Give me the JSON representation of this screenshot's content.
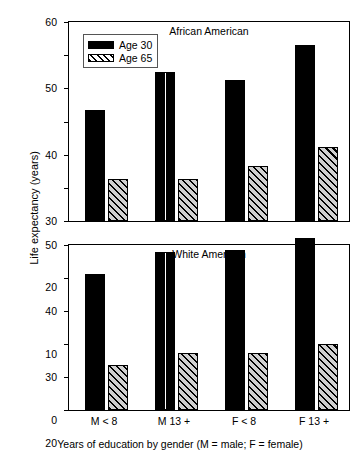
{
  "chart_data": {
    "type": "bar",
    "title": "",
    "xlabel": "Years of education by gender (M = male; F = female)",
    "ylabel": "Life expectancy (years)",
    "categories": [
      "M < 8",
      "M 13 +",
      "F < 8",
      "F 13 +"
    ],
    "legend": {
      "position": "top-left",
      "entries": [
        {
          "name": "Age 30",
          "style": "solid-black"
        },
        {
          "name": "Age 65",
          "style": "diagonal-hatch"
        }
      ]
    },
    "panels": [
      {
        "title": "African American",
        "ylim": [
          0,
          60
        ],
        "yticks": [
          0,
          10,
          20,
          30,
          40,
          50,
          60
        ],
        "grid": false,
        "series": [
          {
            "name": "Age 30",
            "values": [
              33.4,
              45.0,
              42.5,
              53.0
            ]
          },
          {
            "name": "Age 65",
            "values": [
              12.7,
              12.6,
              16.6,
              22.3
            ]
          }
        ]
      },
      {
        "title": "White American",
        "ylim": [
          0,
          50
        ],
        "yticks": [
          0,
          10,
          20,
          30,
          40,
          50
        ],
        "grid": false,
        "series": [
          {
            "name": "Age 30",
            "values": [
              41.2,
              48.0,
              48.4,
              52.2
            ]
          },
          {
            "name": "Age 65",
            "values": [
              13.5,
              17.2,
              17.2,
              19.9
            ]
          }
        ]
      }
    ]
  },
  "colors": {
    "bar_solid": "#000000",
    "bar_hatch_fill": "#cfcfcf",
    "axis": "#000000",
    "background": "#ffffff"
  }
}
